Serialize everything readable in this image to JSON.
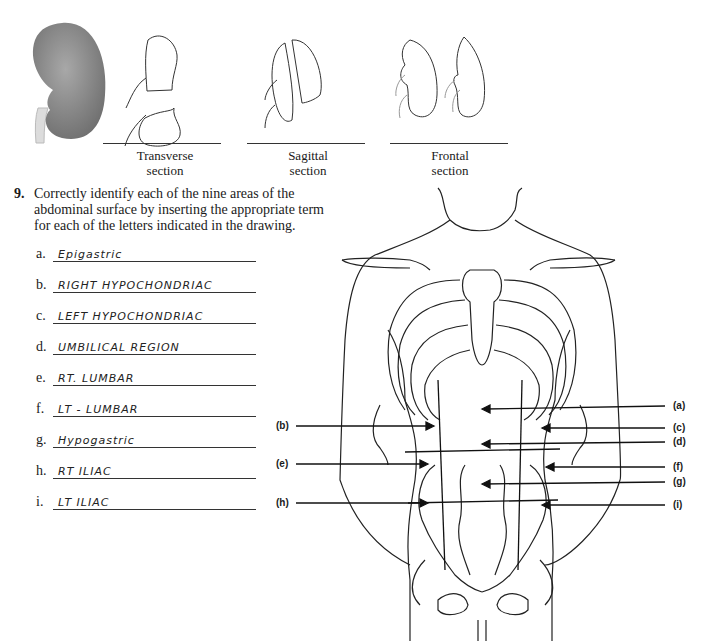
{
  "top_figure": {
    "sections": [
      {
        "id": "transverse",
        "caption_line1": "Transverse",
        "caption_line2": "section"
      },
      {
        "id": "sagittal",
        "caption_line1": "Sagittal",
        "caption_line2": "section"
      },
      {
        "id": "frontal",
        "caption_line1": "Frontal",
        "caption_line2": "section"
      }
    ]
  },
  "question": {
    "number": "9.",
    "text_line1": "Correctly identify each of the nine areas of the",
    "text_line2": "abdominal surface by inserting the appropriate term",
    "text_line3": "for each of the letters indicated in the drawing."
  },
  "answers": [
    {
      "letter": "a.",
      "value": "Epigastric"
    },
    {
      "letter": "b.",
      "value": "RIGHT HYPOCHONDRIAC"
    },
    {
      "letter": "c.",
      "value": "LEFT HYPOCHONDRIAC"
    },
    {
      "letter": "d.",
      "value": "UMBILICAL REGION"
    },
    {
      "letter": "e.",
      "value": "RT. LUMBAR"
    },
    {
      "letter": "f.",
      "value": "LT - LUMBAR"
    },
    {
      "letter": "g.",
      "value": "Hypogastric"
    },
    {
      "letter": "h.",
      "value": "RT ILIAC"
    },
    {
      "letter": "i.",
      "value": "LT ILIAC"
    }
  ],
  "diagram_labels": {
    "a": "(a)",
    "b": "(b)",
    "c": "(c)",
    "d": "(d)",
    "e": "(e)",
    "f": "(f)",
    "g": "(g)",
    "h": "(h)",
    "i": "(i)"
  }
}
